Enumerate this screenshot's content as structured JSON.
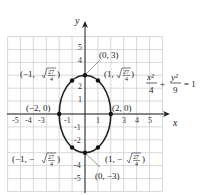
{
  "chart_data": {
    "type": "line",
    "title": "",
    "equation": {
      "x_term_num": "x²",
      "x_term_den": "4",
      "plus": "+",
      "y_term_num": "y²",
      "y_term_den": "9",
      "equals": "= 1"
    },
    "xlabel": "x",
    "ylabel": "y",
    "xlim": [
      -6,
      6
    ],
    "ylim": [
      -6,
      6
    ],
    "grid": true,
    "x_ticks": [
      "-5",
      "-4",
      "-3",
      "-1",
      "1",
      "3",
      "4",
      "5"
    ],
    "x_tick_values": [
      -5,
      -4,
      -3,
      -1,
      1,
      3,
      4,
      5
    ],
    "y_ticks": [
      "5",
      "4",
      "2",
      "1",
      "-1",
      "-2",
      "-4",
      "-5"
    ],
    "y_tick_values": [
      5,
      4,
      2,
      1,
      -1,
      -2,
      -4,
      -5
    ],
    "series": [
      {
        "name": "ellipse x^2/4 + y^2/9 = 1",
        "semi_axis_x": 2,
        "semi_axis_y": 3,
        "color": "#222222"
      }
    ],
    "points": [
      {
        "x": 0,
        "y": 3,
        "label": "(0, 3)"
      },
      {
        "x": 0,
        "y": -3,
        "label": "(0, −3)"
      },
      {
        "x": 2,
        "y": 0,
        "label": "(2, 0)"
      },
      {
        "x": -2,
        "y": 0,
        "label": "(−2, 0)"
      },
      {
        "x": 1,
        "y": 2.598,
        "label_prefix": "(1, ",
        "label_rad_num": "27",
        "label_rad_den": "4",
        "label_suffix": ")"
      },
      {
        "x": -1,
        "y": 2.598,
        "label_prefix": "(−1, ",
        "label_rad_num": "27",
        "label_rad_den": "4",
        "label_suffix": ")"
      },
      {
        "x": 1,
        "y": -2.598,
        "label_prefix": "(1, −",
        "label_rad_num": "27",
        "label_rad_den": "4",
        "label_suffix": ")"
      },
      {
        "x": -1,
        "y": -2.598,
        "label_prefix": "(−1, −",
        "label_rad_num": "27",
        "label_rad_den": "4",
        "label_suffix": ")"
      }
    ]
  }
}
